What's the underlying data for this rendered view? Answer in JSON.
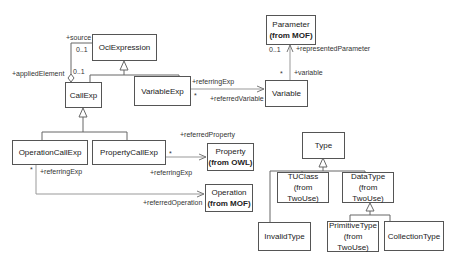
{
  "classes": {
    "ocl_expression": {
      "name": "OclExpression"
    },
    "call_exp": {
      "name": "CallExp"
    },
    "variable_exp": {
      "name": "VariableExp"
    },
    "variable": {
      "name": "Variable"
    },
    "parameter": {
      "name": "Parameter",
      "package": "(from MOF)"
    },
    "operation_call_exp": {
      "name": "OperationCallExp"
    },
    "property_call_exp": {
      "name": "PropertyCallExp"
    },
    "property": {
      "name": "Property",
      "package": "(from OWL)"
    },
    "operation": {
      "name": "Operation",
      "package": "(from MOF)"
    },
    "type": {
      "name": "Type"
    },
    "tuclass": {
      "name": "TUClass",
      "package": "(from TwoUse)"
    },
    "data_type": {
      "name": "DataType",
      "package": "(from TwoUse)"
    },
    "invalid_type": {
      "name": "InvalidType"
    },
    "primitive_type": {
      "name": "PrimitiveType",
      "package": "(from TwoUse)"
    },
    "collection_type": {
      "name": "CollectionType"
    }
  },
  "labels": {
    "source_role": "+source",
    "source_mult": "0..1",
    "applied_role": "+appliedElement",
    "applied_mult": "0..1",
    "varexp_referring_role": "+referringExp",
    "varexp_mult": "*",
    "referred_variable_role": "+referredVariable",
    "param_mult": "0..1",
    "represented_parameter_role": "+representedParameter",
    "variable_mult": "*",
    "variable_role": "+variable",
    "referred_property_role": "+referredProperty",
    "propcall_mult": "*",
    "propcall_referring_role": "+referringExp",
    "opcall_mult": "*",
    "opcall_referring_role": "+referringExp",
    "referred_operation_role": "+referredOperation"
  }
}
